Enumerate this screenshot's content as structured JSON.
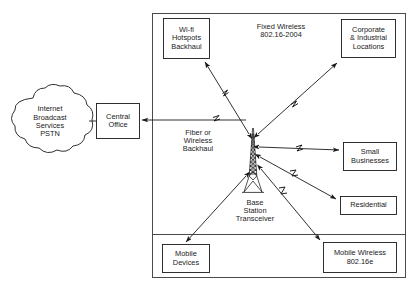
{
  "diagram": {
    "background": "#ffffff",
    "line_color": "#1a1a1a",
    "frame": {
      "name": "wireless-coverage-frame",
      "x": 152,
      "y": 13,
      "width": 254,
      "height": 265,
      "divider_y": 234
    },
    "cloud": {
      "name": "core-network-cloud",
      "text": "Internet\nBroadcast\nServices\nPSTN",
      "lines": [
        "Internet",
        "Broadcast",
        "Services",
        "PSTN"
      ],
      "cx": 50,
      "cy": 122,
      "rx": 44,
      "ry": 32
    },
    "tower": {
      "name": "base-station-tower",
      "label": "Base\nStation\nTransceiver",
      "lines": [
        "Base",
        "Station",
        "Transceiver"
      ],
      "x": 253,
      "top_y": 128,
      "base_y": 192
    },
    "zone_labels": [
      {
        "name": "fixed-wireless-zone-label",
        "text": "Fixed Wireless\n802.16-2004",
        "lines": [
          "Fixed Wireless",
          "802.16-2004"
        ],
        "x": 234,
        "y": 20,
        "width": 94,
        "height": 22
      },
      {
        "name": "backhaul-zone-label",
        "text": "Fiber or\nWireless\nBackhaul",
        "lines": [
          "Fiber or",
          "Wireless",
          "Backhaul"
        ],
        "x": 162,
        "y": 124,
        "width": 72,
        "height": 34
      }
    ],
    "boxes": [
      {
        "name": "central-office-box",
        "text": "Central\nOffice",
        "lines": [
          "Central",
          "Office"
        ],
        "x": 96,
        "y": 103,
        "width": 44,
        "height": 36
      },
      {
        "name": "wifi-hotspots-backhaul-box",
        "text": "Wi-fi\nHotspots\nBackhaul",
        "lines": [
          "Wi-fi",
          "Hotspots",
          "Backhaul"
        ],
        "x": 163,
        "y": 18,
        "width": 47,
        "height": 41
      },
      {
        "name": "corporate-industrial-locations-box",
        "text": "Corporate\n& Industrial\nLocations",
        "lines": [
          "Corporate",
          "& Industrial",
          "Locations"
        ],
        "x": 341,
        "y": 19,
        "width": 55,
        "height": 39
      },
      {
        "name": "small-businesses-box",
        "text": "Small\nBusinesses",
        "lines": [
          "Small",
          "Businesses"
        ],
        "x": 343,
        "y": 142,
        "width": 54,
        "height": 29
      },
      {
        "name": "residential-box",
        "text": "Residential",
        "lines": [
          "Residential"
        ],
        "x": 340,
        "y": 196,
        "width": 57,
        "height": 19
      },
      {
        "name": "mobile-devices-box",
        "text": "Mobile\nDevices",
        "lines": [
          "Mobile",
          "Devices"
        ],
        "x": 162,
        "y": 244,
        "width": 48,
        "height": 29
      },
      {
        "name": "mobile-wireless-box",
        "text": "Mobile Wireless\n802.16e",
        "lines": [
          "Mobile Wireless",
          "802.16e"
        ],
        "x": 323,
        "y": 242,
        "width": 74,
        "height": 31
      }
    ],
    "links": [
      {
        "name": "link-cloud-to-central-office",
        "type": "plain-line",
        "from": "core-network-cloud",
        "to": "central-office-box"
      },
      {
        "name": "link-backhaul-to-central-office",
        "type": "arrow-lightning",
        "from": "base-station-tower",
        "to": "central-office-box"
      },
      {
        "name": "link-tower-to-wifi-hotspots",
        "type": "double-arrow-lightning",
        "from": "base-station-tower",
        "to": "wifi-hotspots-backhaul-box"
      },
      {
        "name": "link-tower-to-corporate",
        "type": "double-arrow-lightning",
        "from": "base-station-tower",
        "to": "corporate-industrial-locations-box"
      },
      {
        "name": "link-tower-to-small-businesses",
        "type": "double-arrow-lightning",
        "from": "base-station-tower",
        "to": "small-businesses-box"
      },
      {
        "name": "link-tower-to-residential",
        "type": "double-arrow-lightning",
        "from": "base-station-tower",
        "to": "residential-box"
      },
      {
        "name": "link-tower-to-mobile-wireless",
        "type": "double-arrow-lightning",
        "from": "base-station-tower",
        "to": "mobile-wireless-box"
      },
      {
        "name": "link-tower-to-mobile-devices",
        "type": "double-arrow-lightning",
        "from": "base-station-tower",
        "to": "mobile-devices-box"
      }
    ]
  }
}
